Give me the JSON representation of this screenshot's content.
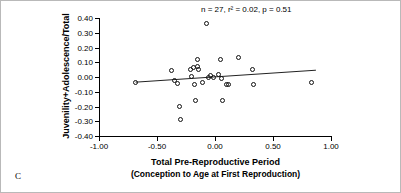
{
  "panel": {
    "label": "C"
  },
  "chart_data": {
    "type": "scatter",
    "title": "",
    "xlabel": "Total Pre-Reproductive Period",
    "xlabel_line2": "(Conception to Age at First Reproduction)",
    "ylabel": "Juvenility+Adolescence/Total",
    "xlim": [
      -1.0,
      1.0
    ],
    "ylim": [
      -0.4,
      0.4
    ],
    "grid": false,
    "legend": null,
    "xticks": [
      -1.0,
      -0.5,
      0.0,
      0.5,
      1.0
    ],
    "xtick_labels": [
      "-1.00",
      "-0.50",
      "0.00",
      "0.50",
      "1.00"
    ],
    "yticks": [
      0.4,
      0.3,
      0.2,
      0.1,
      0.0,
      -0.1,
      -0.2,
      -0.3,
      -0.4
    ],
    "ytick_labels": [
      "0.40",
      "0.30",
      "0.20",
      "0.10",
      "0.00",
      "-0.10",
      "-0.20",
      "-0.30",
      "-0.40"
    ],
    "annotation": "n = 27, r² = 0.02, p = 0.51",
    "stats": {
      "n": 27,
      "r_squared": 0.02,
      "p_value": 0.51
    },
    "marker": {
      "style": "open-circle",
      "color": "#111111",
      "size": 5
    },
    "points": [
      {
        "x": -0.685,
        "y": -0.038
      },
      {
        "x": -0.375,
        "y": 0.043
      },
      {
        "x": -0.35,
        "y": -0.022
      },
      {
        "x": -0.32,
        "y": -0.043
      },
      {
        "x": -0.305,
        "y": -0.198
      },
      {
        "x": -0.295,
        "y": -0.288
      },
      {
        "x": -0.215,
        "y": 0.053
      },
      {
        "x": -0.205,
        "y": 0.005
      },
      {
        "x": -0.185,
        "y": 0.062
      },
      {
        "x": -0.18,
        "y": -0.048
      },
      {
        "x": -0.172,
        "y": -0.158
      },
      {
        "x": -0.155,
        "y": 0.12
      },
      {
        "x": -0.15,
        "y": 0.07
      },
      {
        "x": -0.145,
        "y": 0.048
      },
      {
        "x": -0.105,
        "y": -0.035
      },
      {
        "x": -0.07,
        "y": 0.362
      },
      {
        "x": -0.055,
        "y": -0.003
      },
      {
        "x": -0.04,
        "y": 0.01
      },
      {
        "x": -0.015,
        "y": -0.005
      },
      {
        "x": 0.03,
        "y": 0.018
      },
      {
        "x": 0.045,
        "y": 0.12
      },
      {
        "x": 0.055,
        "y": -0.012
      },
      {
        "x": 0.065,
        "y": -0.158
      },
      {
        "x": 0.095,
        "y": -0.05
      },
      {
        "x": 0.12,
        "y": -0.052
      },
      {
        "x": 0.205,
        "y": 0.135
      },
      {
        "x": 0.325,
        "y": 0.05
      },
      {
        "x": 0.33,
        "y": -0.052
      },
      {
        "x": 0.83,
        "y": -0.04
      }
    ],
    "trendline": {
      "type": "linear",
      "x_start": -0.685,
      "y_start": -0.035,
      "x_end": 0.87,
      "y_end": 0.046,
      "color": "#222222"
    }
  }
}
